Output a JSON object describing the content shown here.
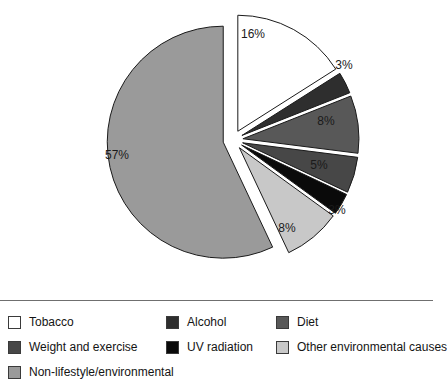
{
  "chart_data": {
    "type": "pie",
    "title": "",
    "subtitle": "",
    "xlabel": "",
    "ylabel": "",
    "legend_position": "bottom",
    "exploded": true,
    "units": "percent",
    "categories": [
      "Non-lifestyle/environmental",
      "Tobacco",
      "Alcohol",
      "Diet",
      "Weight and exercise",
      "UV radiation",
      "Other environmental causes"
    ],
    "values": [
      57,
      16,
      3,
      8,
      5,
      3,
      8
    ],
    "data_labels": [
      "57%",
      "16%",
      "3%",
      "8%",
      "5%",
      "3%",
      "8%"
    ],
    "colors": [
      "#9a9a9a",
      "#ffffff",
      "#2e2e2e",
      "#585858",
      "#474747",
      "#0a0a0a",
      "#c8c8c8"
    ],
    "slices": [
      {
        "label": "Tobacco",
        "value": 16,
        "data_label": "16%",
        "color": "#ffffff",
        "start_angle": 0,
        "end_angle": 57.6,
        "explode": 10,
        "label_x": 253,
        "label_y": 35,
        "label_inside": true
      },
      {
        "label": "Alcohol",
        "value": 3,
        "data_label": "3%",
        "color": "#2e2e2e",
        "start_angle": 57.6,
        "end_angle": 68.4,
        "explode": 10,
        "label_x": 344,
        "label_y": 66,
        "label_inside": false
      },
      {
        "label": "Diet",
        "value": 8,
        "data_label": "8%",
        "color": "#585858",
        "start_angle": 68.4,
        "end_angle": 97.2,
        "explode": 10,
        "label_x": 326,
        "label_y": 122,
        "label_inside": true
      },
      {
        "label": "Weight and exercise",
        "value": 5,
        "data_label": "5%",
        "color": "#474747",
        "start_angle": 97.2,
        "end_angle": 115.2,
        "explode": 10,
        "label_x": 319,
        "label_y": 166,
        "label_inside": true
      },
      {
        "label": "UV radiation",
        "value": 3,
        "data_label": "3%",
        "color": "#0a0a0a",
        "start_angle": 115.2,
        "end_angle": 126.0,
        "explode": 10,
        "label_x": 337,
        "label_y": 211,
        "label_inside": false
      },
      {
        "label": "Other environmental causes",
        "value": 8,
        "data_label": "8%",
        "color": "#c8c8c8",
        "start_angle": 126.0,
        "end_angle": 154.8,
        "explode": 10,
        "label_x": 287,
        "label_y": 229,
        "label_inside": true
      },
      {
        "label": "Non-lifestyle/environmental",
        "value": 57,
        "data_label": "57%",
        "color": "#9a9a9a",
        "start_angle": 154.8,
        "end_angle": 360,
        "explode": 10,
        "label_x": 117,
        "label_y": 156,
        "label_inside": true
      }
    ],
    "geometry": {
      "center_x": 233,
      "center_y": 140,
      "radius": 116,
      "stroke": "#1a1a1a",
      "stroke_width": 1
    }
  },
  "legend": {
    "rows": [
      [
        {
          "label": "Tobacco",
          "color": "#ffffff"
        },
        {
          "label": "Alcohol",
          "color": "#2e2e2e"
        },
        {
          "label": "Diet",
          "color": "#585858"
        }
      ],
      [
        {
          "label": "Weight and exercise",
          "color": "#474747"
        },
        {
          "label": "UV radiation",
          "color": "#0a0a0a"
        },
        {
          "label": "Other environmental causes",
          "color": "#c8c8c8"
        }
      ],
      [
        {
          "label": "Non-lifestyle/environmental",
          "color": "#9a9a9a"
        }
      ]
    ]
  }
}
